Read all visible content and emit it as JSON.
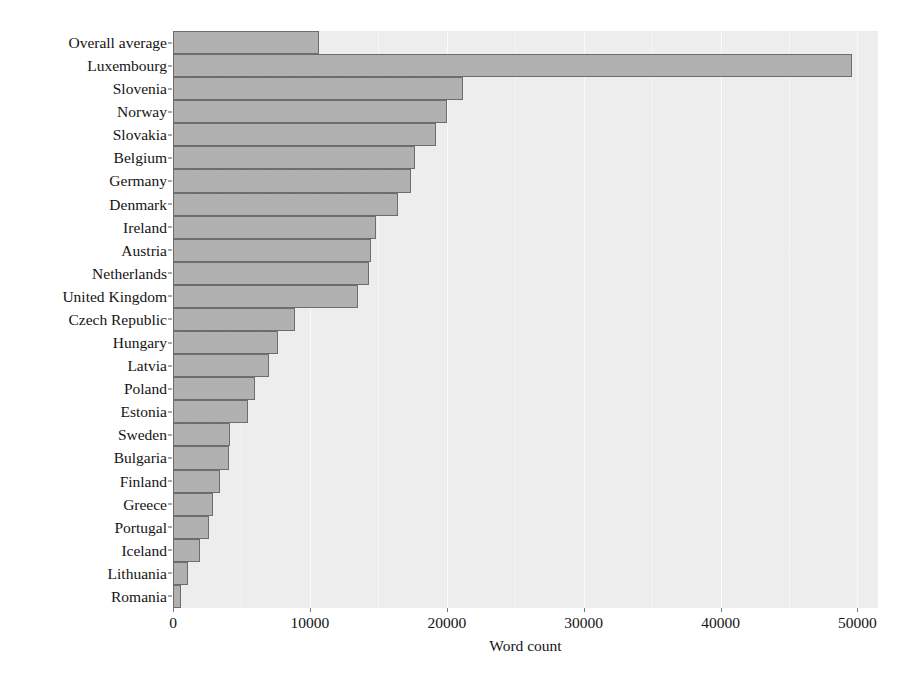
{
  "chart_data": {
    "type": "bar",
    "orientation": "horizontal",
    "title": "",
    "xlabel": "Word count",
    "ylabel": "",
    "xlim": [
      0,
      51500
    ],
    "xticks": [
      0,
      10000,
      20000,
      30000,
      40000,
      50000
    ],
    "xticklabels": [
      "0",
      "10000",
      "20000",
      "30000",
      "40000",
      "50000"
    ],
    "grid": true,
    "legend": null,
    "categories": [
      "Overall average",
      "Luxembourg",
      "Slovenia",
      "Norway",
      "Slovakia",
      "Belgium",
      "Germany",
      "Denmark",
      "Ireland",
      "Austria",
      "Netherlands",
      "United Kingdom",
      "Czech Republic",
      "Hungary",
      "Latvia",
      "Poland",
      "Estonia",
      "Sweden",
      "Bulgaria",
      "Finland",
      "Greece",
      "Portugal",
      "Iceland",
      "Lithuania",
      "Romania"
    ],
    "values": [
      10700,
      49600,
      21200,
      20000,
      19200,
      17700,
      17400,
      16400,
      14800,
      14500,
      14300,
      13500,
      8900,
      7700,
      7000,
      6000,
      5500,
      4200,
      4100,
      3400,
      2900,
      2600,
      2000,
      1100,
      600
    ],
    "bar_color": "#b2b2b2",
    "bar_edge_color": "#6e6e6e",
    "plot_background": "#efefef"
  },
  "axis": {
    "x_title": "Word count"
  }
}
